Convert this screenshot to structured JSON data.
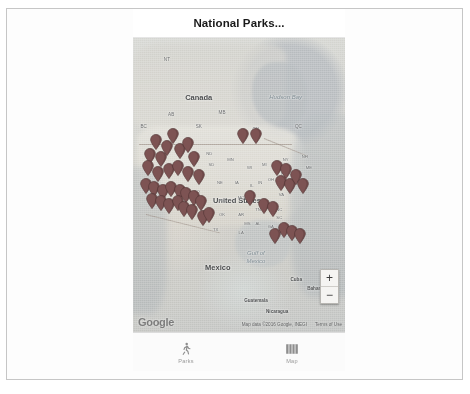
{
  "app": {
    "title": "National Parks...",
    "accent_color": "#8f4b4b",
    "marker_color": "#7d5353",
    "header_bg": "#ffffff"
  },
  "map": {
    "provider_logo": "Google",
    "attribution": "Map data ©2016 Google, INEGI",
    "terms_label": "Terms of Use",
    "zoom_in_label": "+",
    "zoom_out_label": "−",
    "labels": [
      {
        "text": "Canada",
        "kind": "country",
        "x": 31,
        "y": 20
      },
      {
        "text": "United States",
        "kind": "country",
        "x": 49,
        "y": 55
      },
      {
        "text": "Mexico",
        "kind": "country",
        "x": 40,
        "y": 78
      },
      {
        "text": "Hudson Bay",
        "kind": "water",
        "x": 72,
        "y": 20
      },
      {
        "text": "Gulf of",
        "kind": "water",
        "x": 58,
        "y": 73
      },
      {
        "text": "Mexico",
        "kind": "water",
        "x": 58,
        "y": 76
      },
      {
        "text": "Cuba",
        "kind": "small-country",
        "x": 77,
        "y": 82
      },
      {
        "text": "Bahamas",
        "kind": "small-country",
        "x": 87,
        "y": 85
      },
      {
        "text": "Guatemala",
        "kind": "small-country",
        "x": 58,
        "y": 89
      },
      {
        "text": "Nicaragua",
        "kind": "small-country",
        "x": 68,
        "y": 93
      },
      {
        "text": "NT",
        "kind": "region",
        "x": 16,
        "y": 7
      },
      {
        "text": "BC",
        "kind": "region",
        "x": 5,
        "y": 30
      },
      {
        "text": "AB",
        "kind": "region",
        "x": 18,
        "y": 26
      },
      {
        "text": "SK",
        "kind": "region",
        "x": 31,
        "y": 30
      },
      {
        "text": "MB",
        "kind": "region",
        "x": 42,
        "y": 25
      },
      {
        "text": "ON",
        "kind": "region",
        "x": 58,
        "y": 31
      },
      {
        "text": "QC",
        "kind": "region",
        "x": 78,
        "y": 30
      },
      {
        "text": "MN",
        "kind": "state",
        "x": 46,
        "y": 41
      },
      {
        "text": "WI",
        "kind": "state",
        "x": 55,
        "y": 44
      },
      {
        "text": "MI",
        "kind": "state",
        "x": 62,
        "y": 43
      },
      {
        "text": "IA",
        "kind": "state",
        "x": 49,
        "y": 49
      },
      {
        "text": "NE",
        "kind": "state",
        "x": 41,
        "y": 49
      },
      {
        "text": "SD",
        "kind": "state",
        "x": 37,
        "y": 43
      },
      {
        "text": "ND",
        "kind": "state",
        "x": 36,
        "y": 39
      },
      {
        "text": "CO",
        "kind": "state",
        "x": 30,
        "y": 52
      },
      {
        "text": "KS",
        "kind": "state",
        "x": 42,
        "y": 55
      },
      {
        "text": "MO",
        "kind": "state",
        "x": 51,
        "y": 54
      },
      {
        "text": "IL",
        "kind": "state",
        "x": 56,
        "y": 50
      },
      {
        "text": "IN",
        "kind": "state",
        "x": 60,
        "y": 49
      },
      {
        "text": "OH",
        "kind": "state",
        "x": 65,
        "y": 48
      },
      {
        "text": "PA",
        "kind": "state",
        "x": 71,
        "y": 46
      },
      {
        "text": "NY",
        "kind": "state",
        "x": 72,
        "y": 41
      },
      {
        "text": "NH",
        "kind": "state",
        "x": 81,
        "y": 40
      },
      {
        "text": "ME",
        "kind": "state",
        "x": 83,
        "y": 44
      },
      {
        "text": "OK",
        "kind": "state",
        "x": 42,
        "y": 60
      },
      {
        "text": "AR",
        "kind": "state",
        "x": 51,
        "y": 60
      },
      {
        "text": "TN",
        "kind": "state",
        "x": 59,
        "y": 58
      },
      {
        "text": "NC",
        "kind": "state",
        "x": 69,
        "y": 58
      },
      {
        "text": "SC",
        "kind": "state",
        "x": 69,
        "y": 61
      },
      {
        "text": "MS",
        "kind": "state",
        "x": 54,
        "y": 63
      },
      {
        "text": "AL",
        "kind": "state",
        "x": 59,
        "y": 63
      },
      {
        "text": "GA",
        "kind": "state",
        "x": 65,
        "y": 64
      },
      {
        "text": "LA",
        "kind": "state",
        "x": 51,
        "y": 66
      },
      {
        "text": "TX",
        "kind": "state",
        "x": 39,
        "y": 65
      },
      {
        "text": "VA",
        "kind": "state",
        "x": 70,
        "y": 53
      }
    ],
    "markers": [
      {
        "x": 11,
        "y": 38
      },
      {
        "x": 16,
        "y": 40
      },
      {
        "x": 8,
        "y": 43
      },
      {
        "x": 13,
        "y": 44
      },
      {
        "x": 19,
        "y": 36
      },
      {
        "x": 22,
        "y": 41
      },
      {
        "x": 7,
        "y": 47
      },
      {
        "x": 12,
        "y": 49
      },
      {
        "x": 17,
        "y": 48
      },
      {
        "x": 21,
        "y": 47
      },
      {
        "x": 26,
        "y": 39
      },
      {
        "x": 29,
        "y": 44
      },
      {
        "x": 26,
        "y": 49
      },
      {
        "x": 31,
        "y": 50
      },
      {
        "x": 6,
        "y": 53
      },
      {
        "x": 10,
        "y": 54
      },
      {
        "x": 14,
        "y": 55
      },
      {
        "x": 18,
        "y": 54
      },
      {
        "x": 22,
        "y": 55
      },
      {
        "x": 9,
        "y": 58
      },
      {
        "x": 13,
        "y": 59
      },
      {
        "x": 17,
        "y": 60
      },
      {
        "x": 21,
        "y": 59
      },
      {
        "x": 25,
        "y": 56
      },
      {
        "x": 29,
        "y": 57
      },
      {
        "x": 24,
        "y": 61
      },
      {
        "x": 28,
        "y": 62
      },
      {
        "x": 32,
        "y": 59
      },
      {
        "x": 33,
        "y": 64
      },
      {
        "x": 36,
        "y": 63
      },
      {
        "x": 52,
        "y": 36
      },
      {
        "x": 58,
        "y": 36
      },
      {
        "x": 55,
        "y": 57
      },
      {
        "x": 68,
        "y": 47
      },
      {
        "x": 72,
        "y": 48
      },
      {
        "x": 70,
        "y": 52
      },
      {
        "x": 74,
        "y": 53
      },
      {
        "x": 77,
        "y": 50
      },
      {
        "x": 80,
        "y": 53
      },
      {
        "x": 62,
        "y": 60
      },
      {
        "x": 66,
        "y": 61
      },
      {
        "x": 71,
        "y": 68
      },
      {
        "x": 75,
        "y": 69
      },
      {
        "x": 79,
        "y": 70
      },
      {
        "x": 67,
        "y": 70
      }
    ]
  },
  "tabbar": {
    "items": [
      {
        "label": "Parks",
        "icon": "walking-person-icon",
        "selected": false
      },
      {
        "label": "Map",
        "icon": "folded-map-icon",
        "selected": false
      }
    ]
  }
}
